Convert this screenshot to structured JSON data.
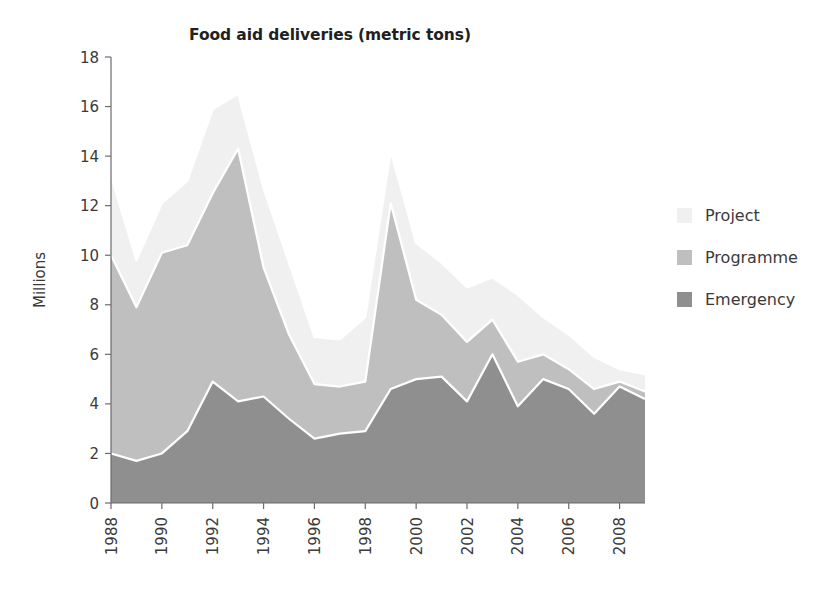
{
  "chart_data": {
    "type": "area",
    "stacked": true,
    "title": "Food aid deliveries (metric tons)",
    "xlabel": "",
    "ylabel": "Millions",
    "ylim": [
      0,
      18
    ],
    "ytick_step": 2,
    "yticks": [
      "0",
      "2",
      "4",
      "6",
      "8",
      "10",
      "12",
      "14",
      "16",
      "18"
    ],
    "grid": false,
    "legend_position": "right",
    "x": [
      1988,
      1989,
      1990,
      1991,
      1992,
      1993,
      1994,
      1995,
      1996,
      1997,
      1998,
      1999,
      2000,
      2001,
      2002,
      2003,
      2004,
      2005,
      2006,
      2007,
      2008,
      2009
    ],
    "xtick_labels": [
      "1988",
      "1990",
      "1992",
      "1994",
      "1996",
      "1998",
      "2000",
      "2002",
      "2004",
      "2006",
      "2008"
    ],
    "xtick_values": [
      1988,
      1990,
      1992,
      1994,
      1996,
      1998,
      2000,
      2002,
      2004,
      2006,
      2008
    ],
    "series": [
      {
        "name": "Emergency",
        "color": "#8f8f8f",
        "values": [
          2.0,
          1.7,
          2.0,
          2.9,
          4.9,
          4.1,
          4.3,
          3.4,
          2.6,
          2.8,
          2.9,
          4.6,
          5.0,
          5.1,
          4.1,
          6.0,
          3.9,
          5.0,
          4.6,
          3.6,
          4.7,
          4.2
        ]
      },
      {
        "name": "Programme",
        "color": "#bfbfbf",
        "values": [
          8.0,
          6.2,
          8.1,
          7.5,
          7.6,
          10.2,
          5.2,
          3.4,
          2.2,
          1.9,
          2.0,
          7.5,
          3.2,
          2.5,
          2.4,
          1.4,
          1.8,
          1.0,
          0.8,
          1.0,
          0.2,
          0.3
        ]
      },
      {
        "name": "Project",
        "color": "#f0f0f0",
        "values": [
          3.2,
          1.9,
          2.0,
          2.6,
          3.4,
          2.2,
          3.2,
          2.9,
          1.9,
          1.9,
          2.6,
          2.1,
          2.3,
          2.1,
          2.2,
          1.7,
          2.7,
          1.5,
          1.4,
          1.3,
          0.5,
          0.7
        ]
      }
    ],
    "series_totals": [
      13.2,
      9.8,
      12.1,
      13.0,
      15.9,
      16.5,
      12.7,
      9.7,
      6.7,
      6.6,
      7.5,
      14.2,
      10.5,
      9.7,
      8.7,
      9.1,
      8.4,
      7.5,
      6.8,
      5.9,
      5.4,
      5.2
    ],
    "emergency_top": [
      2.0,
      1.7,
      2.0,
      2.9,
      4.9,
      4.1,
      4.3,
      3.4,
      2.6,
      2.8,
      2.9,
      4.6,
      5.0,
      5.1,
      4.1,
      6.0,
      3.9,
      5.0,
      4.6,
      3.6,
      4.7,
      4.2
    ],
    "programme_top": [
      10.0,
      7.9,
      10.1,
      10.4,
      12.5,
      14.3,
      9.5,
      6.8,
      4.8,
      4.7,
      4.9,
      12.1,
      8.2,
      7.6,
      6.5,
      7.4,
      5.7,
      6.0,
      5.4,
      4.6,
      4.9,
      4.5
    ]
  },
  "legend": {
    "items": [
      {
        "label": "Project",
        "color": "#f0f0f0"
      },
      {
        "label": "Programme",
        "color": "#bfbfbf"
      },
      {
        "label": "Emergency",
        "color": "#8f8f8f"
      }
    ]
  }
}
